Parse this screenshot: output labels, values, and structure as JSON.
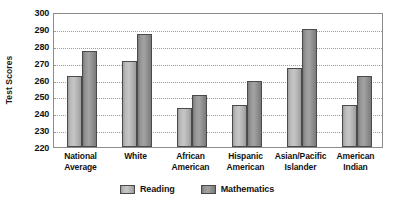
{
  "chart_data": {
    "type": "bar",
    "title": "",
    "xlabel": "",
    "ylabel": "Test Scores",
    "ylim": [
      220,
      300
    ],
    "ytick_step": 10,
    "yticks": [
      300,
      290,
      280,
      270,
      260,
      250,
      240,
      230,
      220
    ],
    "grid": true,
    "grid_axis": "y",
    "grid_style": "dotted",
    "legend_position": "bottom-center",
    "categories": [
      "National Average",
      "White",
      "African American",
      "Hispanic American",
      "Asian/Pacific Islander",
      "American Indian"
    ],
    "category_lines": [
      [
        "National",
        "Average"
      ],
      [
        "White",
        ""
      ],
      [
        "African",
        "American"
      ],
      [
        "Hispanic",
        "American"
      ],
      [
        "Asian/Pacific",
        "Islander"
      ],
      [
        "American",
        "Indian"
      ]
    ],
    "series": [
      {
        "name": "Reading",
        "color": "#bcbcbc",
        "values": [
          262,
          271,
          243,
          245,
          267,
          245
        ]
      },
      {
        "name": "Mathematics",
        "color": "#949494",
        "values": [
          277,
          287,
          251,
          259,
          290,
          262
        ]
      }
    ]
  },
  "colors": {
    "plot_border": "#8c8c8c",
    "gridline": "#9a9a9a",
    "bar_outline": "#4a4a4a",
    "text": "#121212",
    "background": "#ffffff"
  }
}
